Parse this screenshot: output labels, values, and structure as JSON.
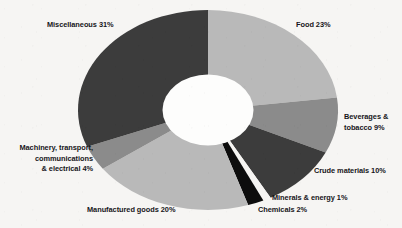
{
  "chart_data": {
    "type": "pie",
    "variant": "donut",
    "title": "",
    "subtitle": "",
    "xlabel": "",
    "ylabel": "",
    "legend_position": "none",
    "labels_mode": "outside-annotations",
    "grid": false,
    "total_percent": 100,
    "unit": "%",
    "categories": [
      "Food",
      "Beverages & tobacco",
      "Crude materials",
      "Minerals & energy",
      "Chemicals",
      "Manufactured goods",
      "Machinery, transport, communications & electrical",
      "Miscellaneous"
    ],
    "values": [
      23,
      9,
      10,
      1,
      2,
      20,
      4,
      31
    ],
    "slices": [
      {
        "name": "Food",
        "value": 23,
        "color": "#b9b9b9"
      },
      {
        "name": "Beverages & tobacco",
        "value": 9,
        "color": "#8b8b8b"
      },
      {
        "name": "Crude materials",
        "value": 10,
        "color": "#3c3c3c"
      },
      {
        "name": "Minerals & energy",
        "value": 1,
        "color": "#f6f5f3"
      },
      {
        "name": "Chemicals",
        "value": 2,
        "color": "#0d0d0d"
      },
      {
        "name": "Manufactured goods",
        "value": 20,
        "color": "#b9b9b9"
      },
      {
        "name": "Machinery, transport, communications & electrical",
        "value": 4,
        "color": "#8b8b8b"
      },
      {
        "name": "Miscellaneous",
        "value": 31,
        "color": "#3c3c3c"
      }
    ]
  },
  "annotations": {
    "food": {
      "text": "Food 23%"
    },
    "beverages": {
      "line1": "Beverages &",
      "line2": "tobacco 9%"
    },
    "crude": {
      "text": "Crude materials 10%"
    },
    "minerals": {
      "text": "Minerals & energy 1%"
    },
    "chemicals": {
      "text": "Chemicals 2%"
    },
    "manufactured": {
      "text": "Manufactured goods 20%"
    },
    "machinery": {
      "line1": "Machinery, transport,",
      "line2": "communications",
      "line3": "& electrical 4%"
    },
    "misc": {
      "text": "Miscellaneous 31%"
    }
  },
  "colors": {
    "background": "#f6f5f3",
    "hole": "#fdfdfc",
    "text": "#16161a",
    "tone_light": "#b9b9b9",
    "tone_mid": "#8b8b8b",
    "tone_dark": "#3c3c3c",
    "tone_black": "#0d0d0d"
  }
}
